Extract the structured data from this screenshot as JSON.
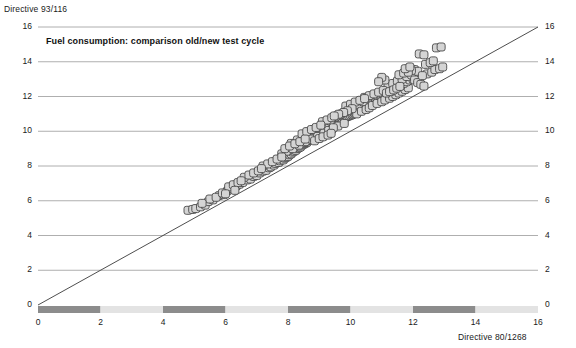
{
  "chart_data": {
    "type": "scatter",
    "title": "Fuel consumption: comparison old/new test cycle",
    "xlabel": "Directive 80/1268",
    "ylabel": "Directive 93/116",
    "xlim": [
      0,
      16
    ],
    "ylim": [
      0,
      16
    ],
    "xticks": [
      0,
      2,
      4,
      6,
      8,
      10,
      12,
      14,
      16
    ],
    "yticks_left": [
      0,
      2,
      4,
      6,
      8,
      10,
      12,
      14,
      16
    ],
    "yticks_right": [
      0,
      2,
      4,
      6,
      8,
      10,
      12,
      14,
      16
    ],
    "grid": "horizontal",
    "legend": "none",
    "reference_line": {
      "name": "y = x identity line",
      "from": [
        0,
        0
      ],
      "to": [
        16,
        16
      ]
    },
    "marker": {
      "shape": "rounded-square",
      "fill": "#d4d4d4",
      "stroke": "#4a4a4a",
      "size_px": 8
    },
    "axis_band_colors": {
      "dark": "#8c8c8c",
      "light": "#e3e3e3"
    },
    "axis_bands": [
      {
        "from": 0,
        "to": 2,
        "shade": "dark"
      },
      {
        "from": 2,
        "to": 4,
        "shade": "light"
      },
      {
        "from": 4,
        "to": 6,
        "shade": "dark"
      },
      {
        "from": 6,
        "to": 8,
        "shade": "light"
      },
      {
        "from": 8,
        "to": 10,
        "shade": "dark"
      },
      {
        "from": 10,
        "to": 12,
        "shade": "light"
      },
      {
        "from": 12,
        "to": 14,
        "shade": "dark"
      },
      {
        "from": 14,
        "to": 16,
        "shade": "light"
      }
    ],
    "series": [
      {
        "name": "vehicles",
        "points": [
          [
            4.8,
            5.45
          ],
          [
            4.95,
            5.5
          ],
          [
            5.05,
            5.55
          ],
          [
            5.2,
            5.65
          ],
          [
            5.35,
            5.75
          ],
          [
            5.45,
            5.95
          ],
          [
            5.6,
            6.05
          ],
          [
            5.8,
            6.3
          ],
          [
            5.95,
            6.35
          ],
          [
            6.05,
            6.55
          ],
          [
            6.2,
            6.7
          ],
          [
            6.35,
            6.85
          ],
          [
            6.45,
            6.95
          ],
          [
            6.55,
            7.05
          ],
          [
            6.7,
            7.2
          ],
          [
            6.8,
            7.25
          ],
          [
            6.9,
            7.4
          ],
          [
            7.0,
            7.45
          ],
          [
            7.1,
            7.6
          ],
          [
            7.2,
            7.7
          ],
          [
            7.3,
            7.75
          ],
          [
            7.4,
            7.9
          ],
          [
            7.45,
            7.95
          ],
          [
            7.55,
            8.05
          ],
          [
            7.6,
            8.15
          ],
          [
            7.7,
            8.2
          ],
          [
            7.75,
            8.3
          ],
          [
            7.85,
            8.35
          ],
          [
            7.9,
            8.45
          ],
          [
            7.95,
            8.5
          ],
          [
            8.0,
            8.55
          ],
          [
            8.05,
            8.65
          ],
          [
            8.1,
            8.7
          ],
          [
            8.15,
            8.8
          ],
          [
            8.2,
            8.85
          ],
          [
            8.25,
            8.9
          ],
          [
            8.3,
            9.0
          ],
          [
            8.35,
            9.05
          ],
          [
            8.4,
            9.1
          ],
          [
            8.45,
            9.2
          ],
          [
            8.5,
            9.25
          ],
          [
            8.55,
            9.3
          ],
          [
            8.6,
            9.35
          ],
          [
            8.62,
            9.45
          ],
          [
            8.65,
            9.5
          ],
          [
            8.7,
            9.55
          ],
          [
            8.75,
            9.6
          ],
          [
            8.8,
            9.65
          ],
          [
            8.85,
            9.7
          ],
          [
            8.9,
            9.75
          ],
          [
            8.95,
            9.8
          ],
          [
            9.0,
            9.85
          ],
          [
            9.05,
            9.9
          ],
          [
            9.1,
            9.95
          ],
          [
            9.15,
            10.0
          ],
          [
            9.2,
            10.05
          ],
          [
            9.25,
            10.1
          ],
          [
            9.3,
            10.15
          ],
          [
            9.35,
            10.2
          ],
          [
            9.4,
            10.25
          ],
          [
            9.42,
            10.3
          ],
          [
            9.45,
            10.35
          ],
          [
            9.5,
            10.4
          ],
          [
            9.55,
            10.45
          ],
          [
            9.6,
            10.5
          ],
          [
            9.65,
            10.55
          ],
          [
            9.7,
            10.6
          ],
          [
            9.72,
            10.65
          ],
          [
            9.75,
            10.7
          ],
          [
            9.8,
            10.75
          ],
          [
            9.85,
            10.8
          ],
          [
            9.9,
            10.85
          ],
          [
            9.95,
            10.88
          ],
          [
            10.0,
            10.92
          ],
          [
            10.05,
            10.95
          ],
          [
            10.08,
            11.0
          ],
          [
            10.12,
            11.05
          ],
          [
            10.15,
            11.1
          ],
          [
            10.2,
            11.15
          ],
          [
            10.25,
            11.18
          ],
          [
            10.3,
            11.22
          ],
          [
            10.35,
            11.25
          ],
          [
            10.4,
            11.3
          ],
          [
            10.45,
            11.35
          ],
          [
            10.5,
            11.4
          ],
          [
            10.55,
            11.45
          ],
          [
            10.58,
            11.5
          ],
          [
            10.62,
            11.55
          ],
          [
            10.65,
            11.58
          ],
          [
            10.7,
            11.62
          ],
          [
            10.75,
            11.65
          ],
          [
            10.8,
            11.7
          ],
          [
            10.85,
            11.75
          ],
          [
            10.9,
            11.8
          ],
          [
            10.95,
            11.85
          ],
          [
            11.0,
            11.9
          ],
          [
            11.05,
            11.95
          ],
          [
            11.1,
            12.0
          ],
          [
            11.15,
            12.05
          ],
          [
            11.2,
            12.1
          ],
          [
            8.1,
            9.3
          ],
          [
            8.3,
            9.5
          ],
          [
            8.5,
            9.7
          ],
          [
            8.7,
            9.9
          ],
          [
            8.9,
            10.1
          ],
          [
            9.05,
            10.25
          ],
          [
            9.2,
            10.45
          ],
          [
            9.35,
            10.6
          ],
          [
            9.5,
            10.8
          ],
          [
            9.65,
            10.95
          ],
          [
            9.8,
            11.1
          ],
          [
            9.95,
            11.25
          ],
          [
            10.1,
            11.4
          ],
          [
            10.25,
            11.55
          ],
          [
            10.4,
            11.7
          ],
          [
            8.0,
            8.9
          ],
          [
            8.2,
            9.1
          ],
          [
            8.4,
            9.3
          ],
          [
            8.6,
            9.45
          ],
          [
            8.8,
            9.6
          ],
          [
            9.0,
            9.75
          ],
          [
            9.2,
            9.95
          ],
          [
            9.4,
            10.1
          ],
          [
            9.6,
            10.3
          ],
          [
            9.8,
            10.45
          ],
          [
            7.8,
            8.7
          ],
          [
            7.95,
            8.85
          ],
          [
            8.15,
            9.0
          ],
          [
            8.35,
            9.2
          ],
          [
            8.55,
            9.4
          ],
          [
            8.75,
            9.55
          ],
          [
            8.95,
            9.7
          ],
          [
            9.15,
            9.9
          ],
          [
            9.3,
            10.05
          ],
          [
            9.45,
            10.2
          ],
          [
            10.2,
            11.0
          ],
          [
            10.35,
            11.15
          ],
          [
            10.5,
            11.25
          ],
          [
            10.6,
            11.35
          ],
          [
            10.7,
            11.48
          ],
          [
            10.85,
            11.6
          ],
          [
            11.0,
            11.7
          ],
          [
            11.1,
            11.8
          ],
          [
            11.25,
            11.9
          ],
          [
            11.35,
            12.0
          ],
          [
            11.45,
            12.1
          ],
          [
            11.55,
            12.2
          ],
          [
            11.65,
            12.3
          ],
          [
            11.75,
            12.4
          ],
          [
            11.85,
            12.5
          ],
          [
            11.3,
            12.3
          ],
          [
            11.4,
            12.45
          ],
          [
            11.5,
            12.55
          ],
          [
            11.6,
            12.65
          ],
          [
            11.7,
            12.75
          ],
          [
            11.8,
            12.85
          ],
          [
            11.9,
            12.95
          ],
          [
            12.0,
            13.0
          ],
          [
            12.1,
            13.05
          ],
          [
            12.2,
            13.1
          ],
          [
            11.2,
            12.6
          ],
          [
            11.35,
            12.75
          ],
          [
            11.5,
            12.9
          ],
          [
            11.65,
            13.0
          ],
          [
            11.8,
            13.15
          ],
          [
            11.95,
            13.25
          ],
          [
            12.05,
            12.95
          ],
          [
            12.15,
            12.8
          ],
          [
            12.25,
            12.7
          ],
          [
            12.35,
            12.6
          ],
          [
            12.45,
            13.3
          ],
          [
            12.6,
            13.4
          ],
          [
            12.7,
            13.55
          ],
          [
            12.85,
            13.6
          ],
          [
            12.95,
            13.7
          ],
          [
            12.2,
            14.45
          ],
          [
            12.35,
            14.4
          ],
          [
            12.75,
            14.8
          ],
          [
            12.9,
            14.85
          ],
          [
            11.1,
            12.95
          ],
          [
            11.0,
            13.1
          ],
          [
            10.9,
            12.85
          ],
          [
            11.55,
            13.25
          ],
          [
            11.7,
            13.35
          ],
          [
            10.45,
            11.95
          ],
          [
            10.6,
            12.05
          ],
          [
            10.75,
            12.15
          ],
          [
            10.9,
            12.25
          ],
          [
            11.05,
            12.35
          ],
          [
            9.85,
            11.45
          ],
          [
            10.0,
            11.55
          ],
          [
            10.15,
            11.68
          ],
          [
            10.3,
            11.78
          ],
          [
            10.45,
            11.88
          ],
          [
            9.1,
            10.55
          ],
          [
            9.25,
            10.65
          ],
          [
            9.4,
            10.78
          ],
          [
            9.55,
            10.88
          ],
          [
            9.7,
            11.0
          ],
          [
            8.45,
            9.85
          ],
          [
            8.6,
            9.98
          ],
          [
            8.75,
            10.1
          ],
          [
            8.9,
            10.22
          ],
          [
            9.05,
            10.35
          ],
          [
            7.9,
            9.0
          ],
          [
            8.05,
            9.15
          ],
          [
            8.22,
            9.28
          ],
          [
            8.38,
            9.4
          ],
          [
            8.55,
            9.55
          ],
          [
            7.2,
            8.0
          ],
          [
            7.35,
            8.12
          ],
          [
            7.5,
            8.25
          ],
          [
            7.65,
            8.4
          ],
          [
            7.8,
            8.52
          ],
          [
            6.6,
            7.35
          ],
          [
            6.75,
            7.48
          ],
          [
            6.9,
            7.6
          ],
          [
            7.05,
            7.72
          ],
          [
            7.15,
            7.85
          ],
          [
            6.1,
            6.8
          ],
          [
            6.25,
            6.92
          ],
          [
            6.4,
            7.05
          ],
          [
            6.5,
            7.15
          ],
          [
            6.3,
            6.6
          ],
          [
            5.5,
            6.1
          ],
          [
            5.7,
            6.2
          ],
          [
            5.9,
            6.45
          ],
          [
            6.0,
            6.4
          ],
          [
            5.25,
            5.85
          ],
          [
            12.05,
            13.55
          ],
          [
            12.15,
            13.45
          ],
          [
            11.95,
            13.5
          ],
          [
            11.85,
            13.4
          ],
          [
            12.3,
            13.2
          ],
          [
            10.05,
            11.3
          ],
          [
            9.9,
            11.18
          ],
          [
            9.78,
            11.08
          ],
          [
            9.62,
            10.98
          ],
          [
            9.48,
            10.88
          ],
          [
            11.15,
            12.2
          ],
          [
            11.25,
            12.28
          ],
          [
            11.38,
            12.38
          ],
          [
            11.48,
            12.48
          ],
          [
            11.58,
            12.58
          ],
          [
            8.85,
            9.45
          ],
          [
            9.0,
            9.58
          ],
          [
            9.12,
            9.68
          ],
          [
            9.28,
            9.78
          ],
          [
            9.38,
            9.88
          ],
          [
            12.4,
            13.85
          ],
          [
            12.55,
            13.95
          ],
          [
            12.65,
            14.05
          ],
          [
            11.75,
            13.6
          ],
          [
            11.9,
            13.7
          ]
        ]
      }
    ]
  }
}
